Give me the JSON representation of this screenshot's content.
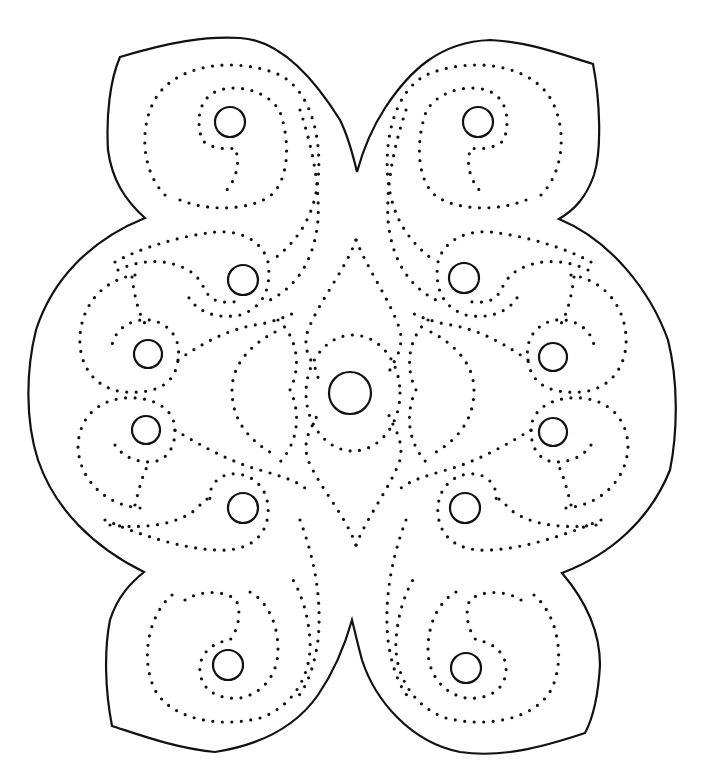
{
  "artwork": {
    "title": "Symmetric four-lobed dotted swirl pattern",
    "line_color": "#111111",
    "background_color": "#ffffff",
    "style": "line-art outline with dotted spiral paths and small circles",
    "symmetry": "bilateral (left-right mirror)",
    "lobes": 4,
    "circles": [
      {
        "id": "center",
        "cx": 350,
        "cy": 393,
        "r": 21
      },
      {
        "id": "top-left-spiral",
        "cx": 230,
        "cy": 122,
        "r": 15
      },
      {
        "id": "top-right-spiral",
        "cx": 478,
        "cy": 122,
        "r": 15
      },
      {
        "id": "upper-left-inner",
        "cx": 243,
        "cy": 280,
        "r": 15
      },
      {
        "id": "upper-right-inner",
        "cx": 464,
        "cy": 278,
        "r": 15
      },
      {
        "id": "mid-left-upper",
        "cx": 148,
        "cy": 354,
        "r": 14
      },
      {
        "id": "mid-right-upper",
        "cx": 553,
        "cy": 357,
        "r": 14
      },
      {
        "id": "mid-left-lower",
        "cx": 146,
        "cy": 430,
        "r": 14
      },
      {
        "id": "mid-right-lower",
        "cx": 553,
        "cy": 432,
        "r": 14
      },
      {
        "id": "lower-left-inner",
        "cx": 243,
        "cy": 508,
        "r": 15
      },
      {
        "id": "lower-right-inner",
        "cx": 465,
        "cy": 508,
        "r": 15
      },
      {
        "id": "bottom-left-spiral",
        "cx": 228,
        "cy": 665,
        "r": 15
      },
      {
        "id": "bottom-right-spiral",
        "cx": 466,
        "cy": 668,
        "r": 15
      }
    ]
  }
}
